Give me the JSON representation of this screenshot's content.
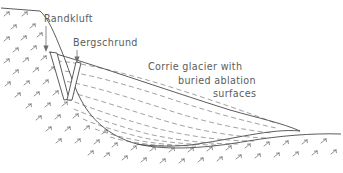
{
  "figure": {
    "kind": "geological-cross-section",
    "background_color": "#ffffff",
    "ink_color": "#4a4a4a",
    "text_color": "#5c5c5c",
    "dash_color": "#8a8a8a",
    "hatch_color": "#6e6e6e"
  },
  "labels": {
    "randkluft": "Randkluft",
    "bergschrund": "Bergschrund",
    "corrie_line1": "Corrie glacier with",
    "corrie_line2": "buried ablation",
    "corrie_line3": "surfaces"
  },
  "label_positions": {
    "randkluft": {
      "x": 44,
      "y": 22
    },
    "bergschrund": {
      "x": 73,
      "y": 46
    },
    "corrie_line1": {
      "x": 148,
      "y": 70
    },
    "corrie_line2": {
      "x": 178,
      "y": 84
    },
    "corrie_line3": {
      "x": 213,
      "y": 97
    }
  },
  "leaders": [
    {
      "name": "randkluft-leader",
      "x": 46,
      "y1": 26,
      "y2": 50
    },
    {
      "name": "bergschrund-leader",
      "x": 77,
      "y1": 50,
      "y2": 62
    }
  ],
  "geometry": {
    "ridge_crest": {
      "x": 40,
      "y": 11
    },
    "headwall_base": {
      "x": 70,
      "y": 100
    },
    "basin_low_point": {
      "x": 137,
      "y": 144
    },
    "snout_tip": {
      "x": 300,
      "y": 131
    },
    "valley_right_end": {
      "x": 341,
      "y": 134
    },
    "glacier_top_left": {
      "x": 49,
      "y": 52
    },
    "glacier_top_right": {
      "x": 272,
      "y": 121
    },
    "randkluft_mouth": {
      "x": 50,
      "y": 52
    },
    "bergschrund_mouth": {
      "x": 77,
      "y": 62
    }
  },
  "elements": {
    "ridge_label": "bedrock ridge crest",
    "headwall_label": "corrie headwall",
    "basin_label": "corrie basin floor",
    "glacier_label": "corrie glacier body",
    "ablation_label": "buried ablation surfaces",
    "randkluft_label": "randkluft crevasse",
    "bergschrund_label": "bergschrund crevasse",
    "bedrock_label": "bedrock hatching"
  },
  "ablation_surface_count": 9,
  "hatch_mark_count": 62
}
